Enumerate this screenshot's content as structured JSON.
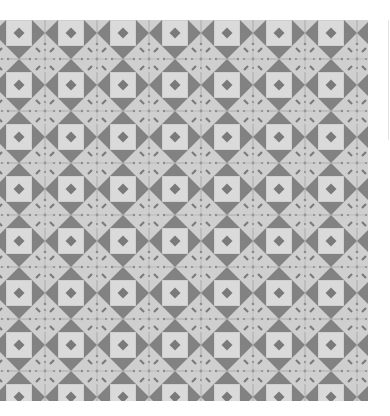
{
  "image": {
    "description": "Geometric tile pattern swatch",
    "pattern": {
      "tile_size_px": 52,
      "columns_visible": 7,
      "rows_visible": 8,
      "elements": [
        "light-square",
        "center-diamond",
        "horizontal-bowtie",
        "vertical-bowtie",
        "dot-star-junction"
      ]
    },
    "colors": {
      "background": "#cfcfcf",
      "square_fill": "#dadada",
      "square_border": "#c4c4c4",
      "dark_shape": "#828282",
      "diamond": "#7a7a7a",
      "thin_line": "#9a9a9a",
      "page": "#ffffff"
    }
  }
}
